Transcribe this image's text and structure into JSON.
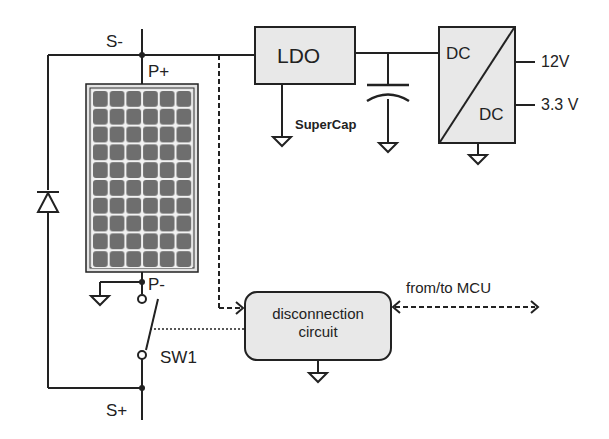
{
  "diagram": {
    "type": "circuit-schematic",
    "colors": {
      "line": "#222222",
      "block_fill": "#e8e8e8",
      "panel_cell": "#6e6e6e",
      "panel_grid": "#f2f2f2"
    },
    "nodes": {
      "s_minus": "S-",
      "p_plus": "P+",
      "p_minus": "P-",
      "s_plus": "S+"
    },
    "blocks": {
      "ldo": "LDO",
      "supercap": "SuperCap",
      "dcdc_in": "DC",
      "dcdc_out": "DC",
      "disconnection_line1": "disconnection",
      "disconnection_line2": "circuit"
    },
    "outputs": {
      "v12": "12V",
      "v33": "3.3 V"
    },
    "switch": "SW1",
    "mcu_link": "from/to MCU",
    "solar_panel": {
      "columns": 6,
      "rows": 10
    },
    "components": [
      "solar-panel",
      "bypass-diode",
      "LDO",
      "SuperCap",
      "DC/DC converter",
      "SW1 switch",
      "disconnection circuit"
    ]
  }
}
